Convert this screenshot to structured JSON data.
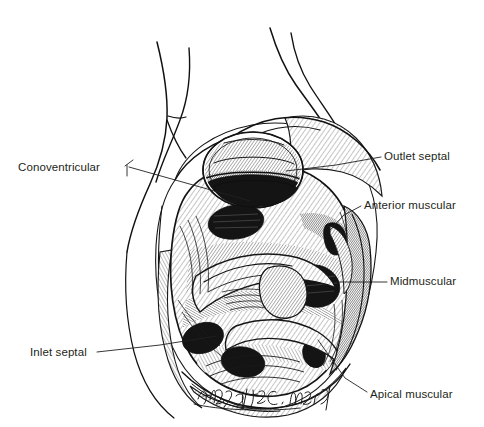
{
  "figure": {
    "kind": "anatomical-line-illustration",
    "background_color": "#ffffff",
    "ink_color": "#231f20",
    "width": 484,
    "height": 427
  },
  "labels": [
    {
      "id": "conoventricular",
      "text": "Conoventricular",
      "text_x": 18,
      "text_y": 171,
      "anchor": "start",
      "leader": "M 125 166 L 133 160 M 127 165 L 127 176 M 129 167 L 250 201"
    },
    {
      "id": "outlet-septal",
      "text": "Outlet septal",
      "text_x": 384,
      "text_y": 160,
      "anchor": "start",
      "leader": "M 381 157 L 336 165 L 286 171"
    },
    {
      "id": "anterior-muscular",
      "text": "Anterior muscular",
      "text_x": 364,
      "text_y": 209,
      "anchor": "start",
      "leader": "M 361 206 L 344 215 L 330 230"
    },
    {
      "id": "midmuscular",
      "text": "Midmuscular",
      "text_x": 390,
      "text_y": 285,
      "anchor": "start",
      "leader": "M 387 282 L 336 282"
    },
    {
      "id": "apical-muscular",
      "text": "Apical muscular",
      "text_x": 370,
      "text_y": 398,
      "anchor": "start",
      "leader": "M 367 392 L 345 378 L 318 340"
    },
    {
      "id": "inlet-septal",
      "text": "Inlet septal",
      "text_x": 30,
      "text_y": 356,
      "anchor": "start",
      "leader": "M 97 352 L 160 345 L 216 336"
    }
  ],
  "signature": {
    "text": "Andy a/ta C. Martin",
    "x": 196,
    "y": 398,
    "style": "handwritten-cursive-ink"
  }
}
